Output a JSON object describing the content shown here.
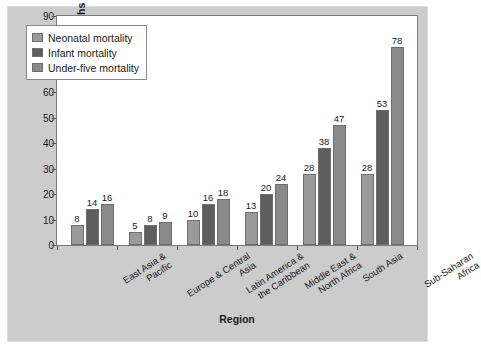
{
  "chart_data": {
    "type": "bar",
    "title": "",
    "xlabel": "Region",
    "ylabel": "Deaths per 1,000 Live Births",
    "ylim": [
      0,
      90
    ],
    "ytick_step": 10,
    "yticks": [
      0,
      10,
      20,
      30,
      40,
      50,
      60,
      70,
      80,
      90
    ],
    "grid": false,
    "legend_position": "top-left",
    "categories": [
      "East Asia & Pacific",
      "Europe & Central Asia",
      "Latin America & the Caribbean",
      "Middle East & North Africa",
      "South Asia",
      "Sub-Saharan Africa"
    ],
    "categories_lines": [
      [
        "East Asia &",
        "Pacific"
      ],
      [
        "Europe & Central",
        "Asia"
      ],
      [
        "Latin America &",
        "the Caribbean"
      ],
      [
        "Middle East &",
        "North Africa"
      ],
      [
        "South Asia",
        ""
      ],
      [
        "Sub-Saharan",
        "Africa"
      ]
    ],
    "series": [
      {
        "name": "Neonatal mortality",
        "color": "#9a9a9a",
        "values": [
          8,
          5,
          10,
          13,
          28,
          28
        ]
      },
      {
        "name": "Infant mortality",
        "color": "#5e5e5e",
        "values": [
          14,
          8,
          16,
          20,
          38,
          53
        ]
      },
      {
        "name": "Under-five mortality",
        "color": "#8a8a8a",
        "values": [
          16,
          9,
          18,
          24,
          47,
          78
        ]
      }
    ]
  },
  "figure": {
    "background_color": "#cccccc",
    "plot_background_color": "#ffffff",
    "border_color": "#7a7a7a"
  }
}
